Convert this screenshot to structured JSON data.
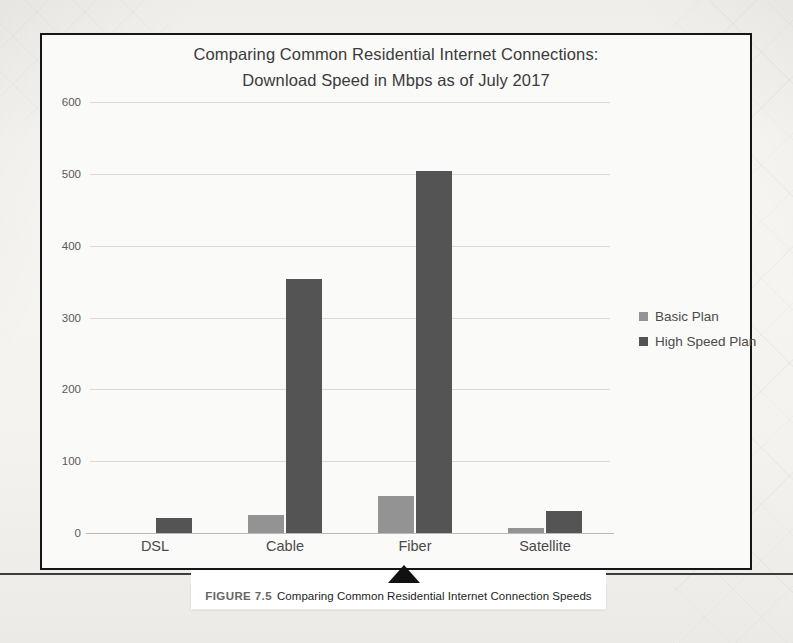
{
  "chart_data": {
    "type": "bar",
    "title": "Comparing Common Residential Internet Connections: Download Speed in Mbps as of July 2017",
    "title_line1": "Comparing Common Residential Internet Connections:",
    "title_line2": "Download Speed in Mbps as of July 2017",
    "xlabel": "",
    "ylabel": "",
    "ylim": [
      0,
      600
    ],
    "ytick_step": 100,
    "yticks": [
      "600",
      "500",
      "400",
      "300",
      "200",
      "100",
      "0"
    ],
    "grid": true,
    "legend_position": "right",
    "categories": [
      "DSL",
      "Cable",
      "Fiber",
      "Satellite"
    ],
    "series": [
      {
        "name": "Basic Plan",
        "color": "#939393",
        "values": [
          1,
          27,
          53,
          8
        ]
      },
      {
        "name": "High Speed Plan",
        "color": "#545454",
        "values": [
          22,
          355,
          505,
          32
        ]
      }
    ]
  },
  "caption": {
    "figure_number": "FIGURE 7.5",
    "text": "Comparing Common Residential Internet Connection Speeds"
  }
}
